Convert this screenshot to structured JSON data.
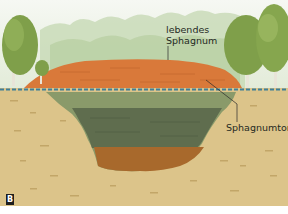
{
  "figure": {
    "panel_letter": "B",
    "labels": {
      "living_sphagnum": [
        "lebendes",
        "Sphagnum"
      ],
      "sphagnum_peat": "Sphagnumtorf"
    },
    "colors": {
      "sky_top": "#f4f7f1",
      "sky_bottom": "#e3ecd9",
      "forest_haze": "#b9d0a4",
      "tree_foliage": "#7f9f4a",
      "living_sphagnum": "#d9793a",
      "water_line": "#3f7f98",
      "peat_upper": "#8a9a6a",
      "peat_middle": "#5f6d4e",
      "peat_bottom": "#a8692c",
      "soil": "#dcc48a"
    }
  }
}
